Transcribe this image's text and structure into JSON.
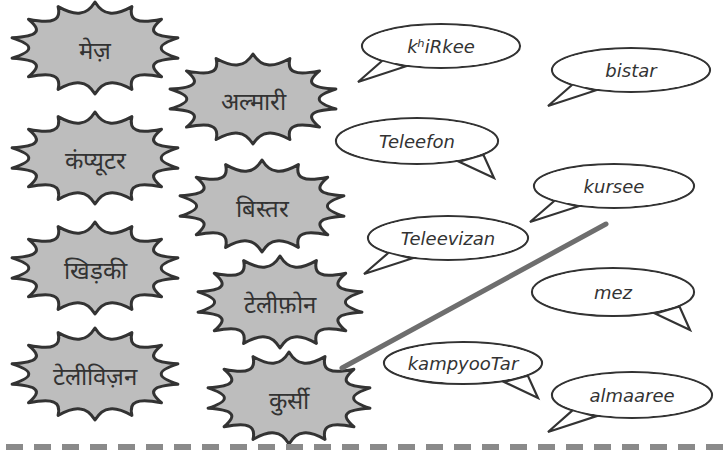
{
  "exercise": {
    "hindi_words": [
      {
        "id": "mez",
        "text": "मेज़",
        "x": 10,
        "y": 2,
        "w": 170,
        "h": 92
      },
      {
        "id": "computer",
        "text": "कंप्यूटर",
        "x": 10,
        "y": 112,
        "w": 170,
        "h": 92
      },
      {
        "id": "khirki",
        "text": "खिड़की",
        "x": 10,
        "y": 222,
        "w": 170,
        "h": 92
      },
      {
        "id": "television",
        "text": "टेलीविज़न",
        "x": 10,
        "y": 328,
        "w": 170,
        "h": 92
      },
      {
        "id": "almari",
        "text": "अल्मारी",
        "x": 168,
        "y": 54,
        "w": 170,
        "h": 90
      },
      {
        "id": "bistar",
        "text": "बिस्तर",
        "x": 178,
        "y": 160,
        "w": 168,
        "h": 92
      },
      {
        "id": "telephone",
        "text": "टेलीफ़ोन",
        "x": 196,
        "y": 256,
        "w": 168,
        "h": 92
      },
      {
        "id": "kursi",
        "text": "कुर्सी",
        "x": 206,
        "y": 352,
        "w": 166,
        "h": 92
      }
    ],
    "transliterations": [
      {
        "id": "khirkee",
        "text": "kʰiRkee",
        "x": 360,
        "y": 22,
        "w": 162,
        "h": 62,
        "tail": "left"
      },
      {
        "id": "bistar",
        "text": "bistar",
        "x": 550,
        "y": 46,
        "w": 162,
        "h": 62,
        "tail": "left"
      },
      {
        "id": "teleefon",
        "text": "Teleefon",
        "x": 334,
        "y": 116,
        "w": 166,
        "h": 64,
        "tail": "right"
      },
      {
        "id": "kursee",
        "text": "kursee",
        "x": 532,
        "y": 162,
        "w": 164,
        "h": 62,
        "tail": "left"
      },
      {
        "id": "teleevizan",
        "text": "Teleevizan",
        "x": 366,
        "y": 214,
        "w": 164,
        "h": 62,
        "tail": "left"
      },
      {
        "id": "mez",
        "text": "mez",
        "x": 530,
        "y": 266,
        "w": 166,
        "h": 66,
        "tail": "right"
      },
      {
        "id": "kampyootar",
        "text": "kampyooTar",
        "x": 382,
        "y": 340,
        "w": 162,
        "h": 60,
        "tail": "right"
      },
      {
        "id": "almaaree",
        "text": "almaaree",
        "x": 550,
        "y": 370,
        "w": 164,
        "h": 64,
        "tail": "left"
      }
    ],
    "matches": [
      {
        "from": "kursi",
        "to": "kursee",
        "x1": 342,
        "y1": 368,
        "x2": 606,
        "y2": 224,
        "color": "#6e6e6e"
      }
    ],
    "colors": {
      "star_fill": "#bdbdbd",
      "outline": "#333333",
      "divider": "#8a8a8a"
    }
  }
}
